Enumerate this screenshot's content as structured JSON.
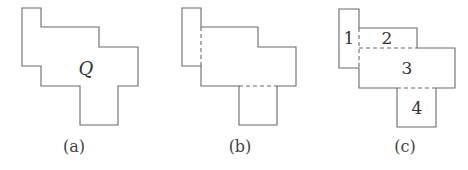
{
  "figure": {
    "panels": [
      {
        "id": "a",
        "caption": "(a)",
        "region_label": "Q",
        "outline": "22,8 41,8 41,27 99,27 99,47 138,47 138,86 118,86 118,125 80,125 80,86 41,86 41,66 22,66"
      },
      {
        "id": "b",
        "caption": "(b)",
        "outline": "182,8 201,8 201,27 258,27 258,47 296,47 296,86 277,86 277,125 239,125 239,86 201,86 201,66 182,66",
        "dashed_cuts": [
          "201,27 201,66",
          "239,86 277,86"
        ]
      },
      {
        "id": "c",
        "caption": "(c)",
        "outline": "339,9 359,9 359,28 417,28 417,48 455,48 455,88 436,88 436,127 397,127 397,88 359,88 359,68 339,68",
        "dashed_cuts": [
          "359,28 359,68",
          "359,48 417,48",
          "397,88 436,88"
        ],
        "region_labels": [
          "1",
          "2",
          "3",
          "4"
        ]
      }
    ],
    "colors": {
      "stroke": "#6b6b6b",
      "text": "#333333"
    }
  }
}
